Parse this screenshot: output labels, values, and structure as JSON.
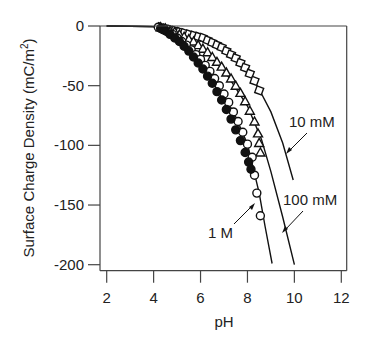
{
  "chart_data": {
    "type": "scatter",
    "title": "",
    "xlabel": "pH",
    "ylabel": "Surface Charge Density (mC/m²)",
    "ylabel_parts": {
      "main": "Surface Charge Density (mC/m",
      "sup": "2",
      "end": ")"
    },
    "xlim": [
      2,
      12.2
    ],
    "ylim": [
      -205,
      0
    ],
    "xticks": [
      2,
      4,
      6,
      8,
      10,
      12
    ],
    "yticks": [
      0,
      -50,
      -100,
      -150,
      -200
    ],
    "grid": false,
    "legend": "none (direct annotations)",
    "series": [
      {
        "name": "10 mM",
        "marker": "square",
        "points": [
          [
            4.3,
            -1
          ],
          [
            4.5,
            -2
          ],
          [
            4.7,
            -3
          ],
          [
            4.9,
            -4
          ],
          [
            5.1,
            -5
          ],
          [
            5.3,
            -6
          ],
          [
            5.5,
            -7
          ],
          [
            5.7,
            -8
          ],
          [
            5.9,
            -9
          ],
          [
            6.1,
            -10
          ],
          [
            6.3,
            -12
          ],
          [
            6.5,
            -14
          ],
          [
            6.7,
            -16
          ],
          [
            6.9,
            -18
          ],
          [
            7.1,
            -21
          ],
          [
            7.3,
            -24
          ],
          [
            7.5,
            -27
          ],
          [
            7.7,
            -31
          ],
          [
            7.9,
            -35
          ],
          [
            8.1,
            -40
          ],
          [
            8.3,
            -46
          ],
          [
            8.5,
            -54
          ]
        ],
        "fit": [
          [
            2,
            0
          ],
          [
            4,
            -0.5
          ],
          [
            5,
            -3
          ],
          [
            6,
            -8
          ],
          [
            7,
            -19
          ],
          [
            8,
            -37
          ],
          [
            8.5,
            -53
          ],
          [
            9,
            -72
          ],
          [
            9.5,
            -98
          ],
          [
            9.95,
            -129
          ]
        ]
      },
      {
        "name": "100 mM",
        "marker": "triangle",
        "points": [
          [
            4.3,
            -1
          ],
          [
            4.5,
            -2
          ],
          [
            4.7,
            -4
          ],
          [
            4.9,
            -5
          ],
          [
            5.1,
            -7
          ],
          [
            5.3,
            -9
          ],
          [
            5.5,
            -11
          ],
          [
            5.7,
            -13
          ],
          [
            5.9,
            -16
          ],
          [
            6.1,
            -19
          ],
          [
            6.3,
            -22
          ],
          [
            6.5,
            -26
          ],
          [
            6.7,
            -30
          ],
          [
            6.9,
            -34
          ],
          [
            7.1,
            -39
          ],
          [
            7.3,
            -44
          ],
          [
            7.5,
            -50
          ],
          [
            7.7,
            -56
          ],
          [
            7.9,
            -63
          ],
          [
            8.1,
            -71
          ],
          [
            8.3,
            -80
          ],
          [
            8.45,
            -90
          ],
          [
            8.5,
            -98
          ],
          [
            8.55,
            -106
          ]
        ],
        "fit": [
          [
            2,
            0
          ],
          [
            4,
            -0.5
          ],
          [
            5,
            -5
          ],
          [
            6,
            -17
          ],
          [
            7,
            -37
          ],
          [
            8,
            -67
          ],
          [
            8.6,
            -95
          ],
          [
            9,
            -122
          ],
          [
            9.5,
            -160
          ],
          [
            10,
            -200
          ]
        ]
      },
      {
        "name": "1 M",
        "marker": "circle",
        "points": [
          [
            4.2,
            -1
          ],
          [
            4.4,
            -3
          ],
          [
            4.6,
            -5
          ],
          [
            4.8,
            -7
          ],
          [
            5.0,
            -10
          ],
          [
            5.2,
            -13
          ],
          [
            5.4,
            -16
          ],
          [
            5.6,
            -20
          ],
          [
            5.8,
            -24
          ],
          [
            6.0,
            -28
          ],
          [
            6.2,
            -33
          ],
          [
            6.4,
            -38
          ],
          [
            6.6,
            -44
          ],
          [
            6.8,
            -50
          ],
          [
            7.0,
            -57
          ],
          [
            7.2,
            -64
          ],
          [
            7.4,
            -72
          ],
          [
            7.6,
            -80
          ],
          [
            7.8,
            -89
          ],
          [
            8.0,
            -99
          ],
          [
            8.2,
            -110
          ],
          [
            8.3,
            -125
          ],
          [
            8.4,
            -140
          ],
          [
            8.55,
            -159
          ]
        ],
        "filled_points": [
          [
            4.3,
            -2
          ],
          [
            4.5,
            -4
          ],
          [
            4.7,
            -7
          ],
          [
            4.9,
            -10
          ],
          [
            5.1,
            -13
          ],
          [
            5.3,
            -17
          ],
          [
            5.5,
            -21
          ],
          [
            5.7,
            -26
          ],
          [
            5.9,
            -31
          ],
          [
            6.1,
            -36
          ],
          [
            6.3,
            -42
          ],
          [
            6.5,
            -48
          ],
          [
            6.7,
            -55
          ],
          [
            6.9,
            -62
          ],
          [
            7.1,
            -70
          ],
          [
            7.3,
            -78
          ],
          [
            7.5,
            -87
          ],
          [
            7.7,
            -96
          ],
          [
            7.9,
            -106
          ],
          [
            8.05,
            -114
          ],
          [
            8.15,
            -120
          ]
        ],
        "fit": [
          [
            2,
            0
          ],
          [
            4,
            -0.5
          ],
          [
            5,
            -10
          ],
          [
            6,
            -29
          ],
          [
            7,
            -58
          ],
          [
            7.5,
            -76
          ],
          [
            8,
            -99
          ],
          [
            8.5,
            -140
          ],
          [
            8.75,
            -168
          ],
          [
            9.05,
            -199
          ]
        ]
      }
    ],
    "annotations": [
      {
        "text": "10 mM",
        "series": "10 mM"
      },
      {
        "text": "100 mM",
        "series": "100 mM"
      },
      {
        "text": "1 M",
        "series": "1 M"
      }
    ]
  }
}
